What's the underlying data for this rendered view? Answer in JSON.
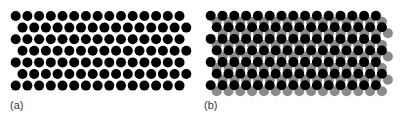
{
  "figure": {
    "width": 400,
    "height": 120,
    "background": "#ffffff",
    "colors": {
      "layer_1": "#000000",
      "layer_2": "#8a8a8a",
      "label": "#333333"
    },
    "circle_radius": 5,
    "panels": [
      {
        "id": "a",
        "label": "(a)",
        "label_pos": [
          10,
          109
        ],
        "layers": [
          {
            "name": "single-layer-black",
            "color_key": "layer_1",
            "rows": 7,
            "cols": 15,
            "x0": 15.7,
            "y0": 16,
            "dx": 11.7,
            "dy": 11.6,
            "odd_row_shift": 6.8
          }
        ]
      },
      {
        "id": "b",
        "label": "(b)",
        "label_pos": [
          204,
          109
        ],
        "layers": [
          {
            "name": "bottom-layer-gray",
            "color_key": "layer_2",
            "rows": 7,
            "cols": 15,
            "x0": 216.7,
            "y0": 21.7,
            "dx": 11.8,
            "dy": 11.6,
            "odd_row_shift": 6.0
          },
          {
            "name": "top-layer-black",
            "color_key": "layer_1",
            "rows": 7,
            "cols": 15,
            "x0": 210.7,
            "y0": 15.7,
            "dx": 11.8,
            "dy": 11.6,
            "odd_row_shift": 6.0
          }
        ]
      }
    ]
  }
}
